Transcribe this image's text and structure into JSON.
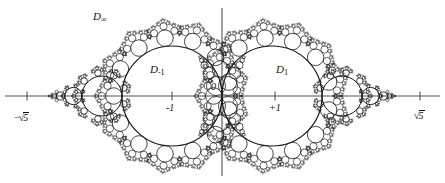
{
  "figure": {
    "kind": "apollonian-circle-packing-diagram",
    "width": 445,
    "height": 183,
    "background_color": "#ffffff",
    "stroke_color": "#1a1a1a",
    "axis_color": "#555555"
  },
  "axes": {
    "horizontal": {
      "y": 96,
      "x_start": 5,
      "x_end": 440
    },
    "vertical": {
      "x": 222,
      "y_start": 8,
      "y_end": 176
    },
    "ticks": [
      {
        "name": "tick-minus-sqrt5",
        "x": 27,
        "label": "-√5"
      },
      {
        "name": "tick-minus-one",
        "x": 172,
        "label": "-1"
      },
      {
        "name": "tick-plus-one",
        "x": 275,
        "label": "+1"
      },
      {
        "name": "tick-plus-sqrt5",
        "x": 420,
        "label": "√5"
      }
    ]
  },
  "labels": {
    "d_infinity": {
      "text": "D",
      "sub": "∞",
      "x": 93,
      "y": 11
    },
    "d_minus_one": {
      "text": "D",
      "sub": "-1",
      "x": 150,
      "y": 64
    },
    "d_plus_one": {
      "text": "D",
      "sub": "1",
      "x": 276,
      "y": 64
    },
    "origin": {
      "text": "0",
      "x": 211,
      "y": 82
    },
    "minus_one": {
      "text": "-1",
      "x": 166,
      "y": 103
    },
    "plus_one": {
      "text": "+1",
      "x": 269,
      "y": 103
    },
    "minus_sqrt_five": {
      "radsign": "−√",
      "under": "5",
      "x": 14,
      "y": 112
    },
    "plus_sqrt_five": {
      "radsign": "√",
      "under": "5",
      "x": 414,
      "y": 110
    }
  },
  "geometry": {
    "origin_x": 222,
    "origin_y": 96,
    "unit_px": 50,
    "main_circles": [
      {
        "name": "circle-D-minus-1",
        "cx": 172,
        "cy": 96,
        "r": 50
      },
      {
        "name": "circle-D-plus-1",
        "cx": 272,
        "cy": 96,
        "r": 50
      }
    ],
    "side_chain": {
      "radii": [
        20,
        8.6,
        4.1,
        2.2,
        1.3,
        0.8
      ],
      "left_start_x": 122,
      "right_start_x": 322,
      "direction_left": -1,
      "direction_right": 1
    },
    "satellites": {
      "ring_count": 13,
      "ring_radius_ratio": 0.165,
      "child_levels": 3,
      "child_count": 3,
      "child_radius_ratio": 0.44,
      "child_spread_deg": 118
    }
  },
  "chart_data": {
    "type": "diagram",
    "annotations": [
      "D∞",
      "D₋₁",
      "D₁",
      "0",
      "-1",
      "+1",
      "-√5",
      "√5"
    ],
    "axis_marks": [
      -2.2360679,
      -1,
      0,
      1,
      2.2360679
    ]
  }
}
